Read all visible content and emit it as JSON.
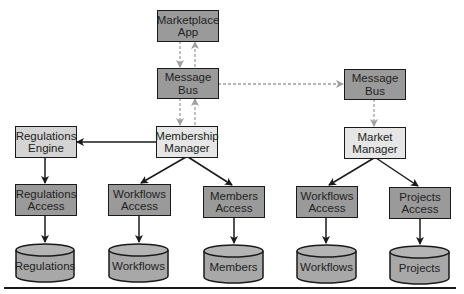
{
  "diagram": {
    "type": "architecture",
    "colors": {
      "service_fill": "#9a9a9a",
      "manager_fill": "#e6e6e6",
      "store_fill": "#a8a8a8",
      "solid_arrow": "#1a1a1a",
      "dashed_arrow": "#a0a0a0"
    },
    "nodes": {
      "marketplace_app": {
        "label_1": "Marketplace",
        "label_2": "App"
      },
      "message_bus_left": {
        "label_1": "Message",
        "label_2": "Bus"
      },
      "message_bus_right": {
        "label_1": "Message",
        "label_2": "Bus"
      },
      "membership_manager": {
        "label_1": "Membership",
        "label_2": "Manager"
      },
      "market_manager": {
        "label_1": "Market",
        "label_2": "Manager"
      },
      "regulations_engine": {
        "label_1": "Regulations",
        "label_2": "Engine"
      },
      "regulations_access": {
        "label_1": "Regulations",
        "label_2": "Access"
      },
      "workflows_access_left": {
        "label_1": "Workflows",
        "label_2": "Access"
      },
      "members_access": {
        "label_1": "Members",
        "label_2": "Access"
      },
      "workflows_access_right": {
        "label_1": "Workflows",
        "label_2": "Access"
      },
      "projects_access": {
        "label_1": "Projects",
        "label_2": "Access"
      }
    },
    "stores": {
      "regulations": "Regulations",
      "workflows_left": "Workflows",
      "members": "Members",
      "workflows_right": "Workflows",
      "projects": "Projects"
    },
    "edges": [
      {
        "from": "marketplace_app",
        "to": "message_bus_left",
        "style": "dashed"
      },
      {
        "from": "message_bus_left",
        "to": "marketplace_app",
        "style": "dashed"
      },
      {
        "from": "message_bus_left",
        "to": "membership_manager",
        "style": "dashed"
      },
      {
        "from": "membership_manager",
        "to": "message_bus_left",
        "style": "dashed"
      },
      {
        "from": "message_bus_left",
        "to": "message_bus_right",
        "style": "dashed"
      },
      {
        "from": "message_bus_right",
        "to": "market_manager",
        "style": "dashed"
      },
      {
        "from": "membership_manager",
        "to": "regulations_engine",
        "style": "solid"
      },
      {
        "from": "membership_manager",
        "to": "workflows_access_left",
        "style": "solid"
      },
      {
        "from": "membership_manager",
        "to": "members_access",
        "style": "solid"
      },
      {
        "from": "market_manager",
        "to": "workflows_access_right",
        "style": "solid"
      },
      {
        "from": "market_manager",
        "to": "projects_access",
        "style": "solid"
      },
      {
        "from": "regulations_engine",
        "to": "regulations_access",
        "style": "solid"
      },
      {
        "from": "regulations_access",
        "to": "regulations",
        "style": "solid"
      },
      {
        "from": "workflows_access_left",
        "to": "workflows_left",
        "style": "solid"
      },
      {
        "from": "members_access",
        "to": "members",
        "style": "solid"
      },
      {
        "from": "workflows_access_right",
        "to": "workflows_right",
        "style": "solid"
      },
      {
        "from": "projects_access",
        "to": "projects",
        "style": "solid"
      }
    ]
  }
}
